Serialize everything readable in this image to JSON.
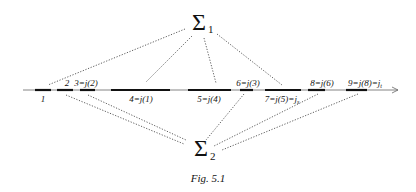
{
  "figure": {
    "caption": "Fig. 5.1",
    "top_node": {
      "symbol": "Σ",
      "subscript": "1"
    },
    "bottom_node": {
      "symbol": "Σ",
      "subscript": "2"
    },
    "axis": {
      "direction": "right",
      "has_arrow": true
    },
    "segments": [
      {
        "id": "1",
        "label": "1",
        "label_position": "below"
      },
      {
        "id": "2",
        "label": "2",
        "label_position": "above"
      },
      {
        "id": "3",
        "label": "3=j(2)",
        "label_position": "above"
      },
      {
        "id": "4",
        "label": "4=j(1)",
        "label_position": "below"
      },
      {
        "id": "5",
        "label": "5=j(4)",
        "label_position": "below"
      },
      {
        "id": "6",
        "label": "6=j(3)",
        "label_position": "above"
      },
      {
        "id": "7",
        "label": "7=j(5)=j",
        "label_sub": "s",
        "label_position": "below"
      },
      {
        "id": "8",
        "label": "8=j(6)",
        "label_position": "above"
      },
      {
        "id": "9",
        "label": "9=j(8)=j",
        "label_sub": "t",
        "label_position": "above"
      }
    ],
    "connections_top": [
      "1",
      "4",
      "5",
      "7"
    ],
    "connections_bottom": [
      "2",
      "3",
      "6",
      "8",
      "9"
    ]
  }
}
